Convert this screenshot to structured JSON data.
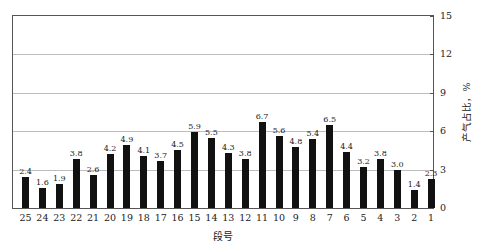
{
  "chart_data": {
    "type": "bar",
    "title": "",
    "xlabel": "段号",
    "ylabel": "产气占比，%",
    "ylim": [
      0,
      15
    ],
    "yticks": [
      0,
      3,
      6,
      9,
      12,
      15
    ],
    "y_axis_position": "right",
    "grid": {
      "horizontal": true,
      "vertical": false
    },
    "legend": null,
    "categories": [
      "25",
      "24",
      "23",
      "22",
      "21",
      "20",
      "19",
      "18",
      "17",
      "16",
      "15",
      "14",
      "13",
      "12",
      "11",
      "10",
      "9",
      "8",
      "7",
      "6",
      "5",
      "4",
      "3",
      "2",
      "1"
    ],
    "values": [
      2.4,
      1.6,
      1.9,
      3.8,
      2.6,
      4.2,
      4.9,
      4.1,
      3.7,
      4.5,
      5.9,
      5.5,
      4.3,
      3.8,
      6.7,
      5.6,
      4.8,
      5.4,
      6.5,
      4.4,
      3.2,
      3.8,
      3.0,
      1.4,
      2.3
    ],
    "data_labels": [
      "2.4",
      "1.6",
      "1.9",
      "3.8",
      "2.6",
      "4.2",
      "4.9",
      "4.1",
      "3.7",
      "4.5",
      "5.9",
      "5.5",
      "4.3",
      "3.8",
      "6.7",
      "5.6",
      "4.8",
      "5.4",
      "6.5",
      "4.4",
      "3.2",
      "3.8",
      "3.0",
      "1.4",
      "2.3"
    ],
    "bar_color": "#111111"
  }
}
